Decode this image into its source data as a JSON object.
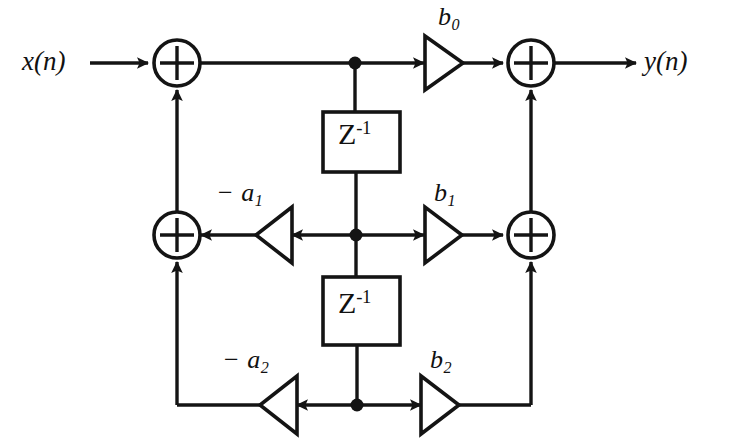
{
  "diagram": {
    "stroke_color": "#141414",
    "background_color": "#ffffff",
    "signals": {
      "input_label": "x(n)",
      "output_label": "y(n)"
    },
    "delay_blocks": [
      {
        "id": "delay-1",
        "symbol_base": "Z",
        "symbol_exp": "-1"
      },
      {
        "id": "delay-2",
        "symbol_base": "Z",
        "symbol_exp": "-1"
      }
    ],
    "feedforward_gains": [
      {
        "id": "gain-b0",
        "base": "b",
        "subscript": "0",
        "sign": "",
        "direction": "right"
      },
      {
        "id": "gain-b1",
        "base": "b",
        "subscript": "1",
        "sign": "",
        "direction": "right"
      },
      {
        "id": "gain-b2",
        "base": "b",
        "subscript": "2",
        "sign": "",
        "direction": "right"
      }
    ],
    "feedback_gains": [
      {
        "id": "gain-a1",
        "base": "a",
        "subscript": "1",
        "sign": "− ",
        "direction": "left"
      },
      {
        "id": "gain-a2",
        "base": "a",
        "subscript": "2",
        "sign": "− ",
        "direction": "left"
      }
    ],
    "adders": [
      {
        "id": "adder-top-left",
        "symbol": "+"
      },
      {
        "id": "adder-top-right",
        "symbol": "+"
      },
      {
        "id": "adder-mid-left",
        "symbol": "+"
      },
      {
        "id": "adder-mid-right",
        "symbol": "+"
      }
    ],
    "junction_count": 3
  }
}
